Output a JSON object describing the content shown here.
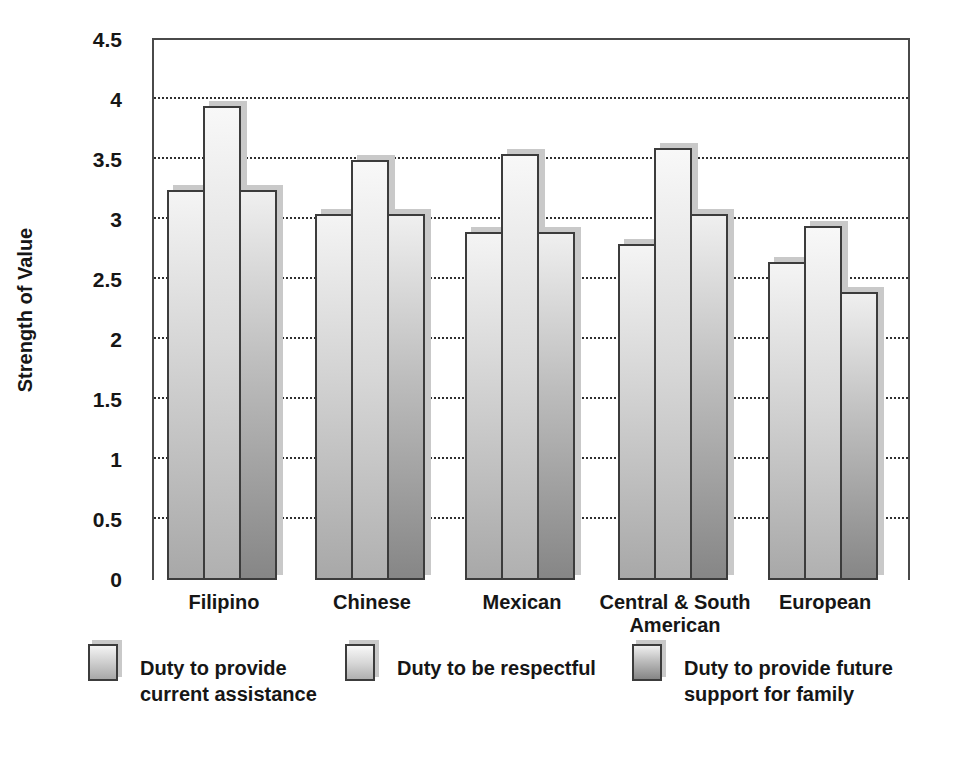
{
  "figure_background": "#ffffff",
  "chart_data": {
    "type": "bar",
    "title": "",
    "xlabel": "",
    "ylabel": "Strength of Value",
    "ylim": [
      0,
      4.5
    ],
    "grid": "horizontal dotted lines every 0.5",
    "legend_position": "bottom",
    "yticks": [
      {
        "label": "0",
        "value": 0
      },
      {
        "label": "0.5",
        "value": 0.5
      },
      {
        "label": "1",
        "value": 1
      },
      {
        "label": "1.5",
        "value": 1.5
      },
      {
        "label": "2",
        "value": 2
      },
      {
        "label": "2.5",
        "value": 2.5
      },
      {
        "label": "3",
        "value": 3
      },
      {
        "label": "3.5",
        "value": 3.5
      },
      {
        "label": "4",
        "value": 4
      },
      {
        "label": "4.5",
        "value": 4.5
      }
    ],
    "categories": [
      "Filipino",
      "Chinese",
      "Mexican",
      "Central & South American",
      "European"
    ],
    "series": [
      {
        "name": "Duty to provide current assistance",
        "values": [
          3.25,
          3.05,
          2.9,
          2.8,
          2.65
        ]
      },
      {
        "name": "Duty to be respectful",
        "values": [
          3.95,
          3.5,
          3.55,
          3.6,
          2.95
        ]
      },
      {
        "name": "Duty to provide future support for family",
        "values": [
          3.25,
          3.05,
          2.9,
          3.05,
          2.4
        ]
      }
    ],
    "colors": {
      "series1_gradient_top": "#f4f4f4",
      "series1_gradient_bottom": "#a8a8a8",
      "series2_gradient_top": "#f8f8f8",
      "series2_gradient_bottom": "#b0b0b0",
      "series3_gradient_top": "#efefef",
      "series3_gradient_bottom": "#868686",
      "bar_outline": "#3c3c3c",
      "bar_shadow": "#c9c9c9",
      "axis_line": "#4a4a4a",
      "gridline": "#2f2f2f",
      "text": "#161616"
    }
  }
}
